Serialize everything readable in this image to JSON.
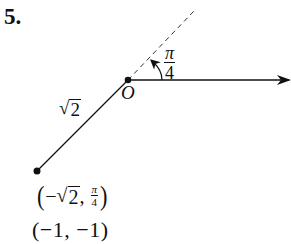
{
  "problem": {
    "number": "5."
  },
  "origin": {
    "label": "O"
  },
  "angle": {
    "numerator": "π",
    "denominator": "4"
  },
  "segment": {
    "radical": "√",
    "radicand": "2"
  },
  "polar_point": {
    "open": "(",
    "minus": "−",
    "radical": "√",
    "radicand": "2",
    "comma": ",",
    "theta_numerator": "π",
    "theta_denominator": "4",
    "close": ")"
  },
  "rect_point": {
    "text": "(−1, −1)"
  },
  "colors": {
    "ink": "#111111",
    "background": "#ffffff"
  }
}
